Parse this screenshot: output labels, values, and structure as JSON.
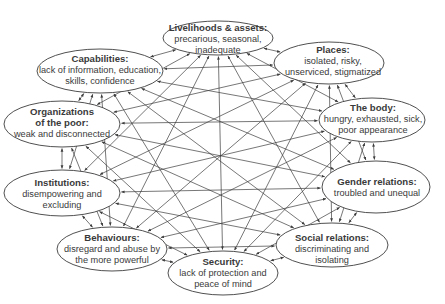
{
  "diagram": {
    "type": "interconnected-ellipse-network",
    "colors": {
      "line": "#3c3c3c",
      "text": "#3a3a3a",
      "fill": "#ffffff"
    },
    "nodes": [
      {
        "id": "livelihoods",
        "title": "Livelihoods & assets:",
        "desc": [
          "precarious, seasonal,",
          "inadequate"
        ],
        "cx": 218,
        "cy": 38,
        "rx": 55,
        "ry": 17
      },
      {
        "id": "places",
        "title": "Places:",
        "desc": [
          "isolated, risky,",
          "unserviced, stigmatized"
        ],
        "cx": 329,
        "cy": 63,
        "rx": 55,
        "ry": 21
      },
      {
        "id": "body",
        "title": "The body:",
        "desc": [
          "hungry, exhausted, sick,",
          "poor appearance"
        ],
        "cx": 372,
        "cy": 120,
        "rx": 53,
        "ry": 22
      },
      {
        "id": "gender",
        "title": "Gender relations:",
        "desc": [
          "troubled and unequal"
        ],
        "cx": 376,
        "cy": 187,
        "rx": 54,
        "ry": 26
      },
      {
        "id": "social",
        "title": "Social relations:",
        "desc": [
          "discriminating and",
          "isolating"
        ],
        "cx": 332,
        "cy": 245,
        "rx": 56,
        "ry": 22
      },
      {
        "id": "security",
        "title": "Security:",
        "desc": [
          "lack of protection and",
          "peace of mind"
        ],
        "cx": 223,
        "cy": 273,
        "rx": 55,
        "ry": 22
      },
      {
        "id": "behaviours",
        "title": "Behaviours:",
        "desc": [
          "disregard and abuse by",
          "the more powerful"
        ],
        "cx": 112,
        "cy": 249,
        "rx": 55,
        "ry": 22
      },
      {
        "id": "institutions",
        "title": "Institutions:",
        "desc": [
          "disempowering and",
          "excluding"
        ],
        "cx": 62,
        "cy": 193,
        "rx": 58,
        "ry": 23
      },
      {
        "id": "organizations",
        "title": "Organizations",
        "title2": "of the poor:",
        "desc": [
          "weak and disconnected"
        ],
        "cx": 62,
        "cy": 124,
        "rx": 58,
        "ry": 23
      },
      {
        "id": "capabilities",
        "title": "Capabilities:",
        "desc": [
          "lack of information, education,",
          "skills, confidence"
        ],
        "cx": 100,
        "cy": 71,
        "rx": 63,
        "ry": 22
      }
    ],
    "edges": "all-pairs bidirectional arrows"
  }
}
